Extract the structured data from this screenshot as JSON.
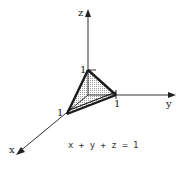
{
  "diagram": {
    "axes": {
      "x_label": "x",
      "y_label": "y",
      "z_label": "z"
    },
    "intercepts": {
      "x": "1",
      "y": "1",
      "z": "1"
    },
    "equation": "x + y + z = 1",
    "colors": {
      "line": "#222222",
      "fill": "#d9d9d9",
      "background": "#ffffff"
    }
  }
}
